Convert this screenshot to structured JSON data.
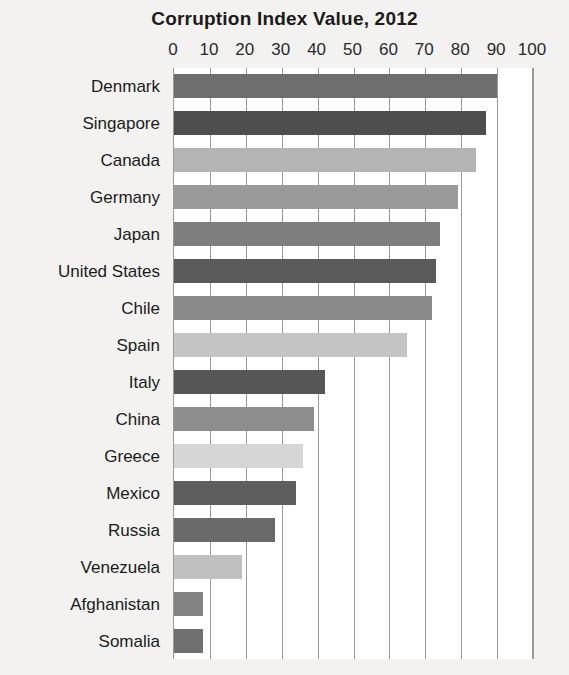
{
  "chart_data": {
    "type": "bar",
    "orientation": "horizontal",
    "title": "Corruption Index Value, 2012",
    "xlabel": "",
    "ylabel": "",
    "xlim": [
      0,
      100
    ],
    "xticks": [
      0,
      10,
      20,
      30,
      40,
      50,
      60,
      70,
      80,
      90,
      100
    ],
    "grid": true,
    "legend": "none",
    "categories": [
      "Denmark",
      "Singapore",
      "Canada",
      "Germany",
      "Japan",
      "United States",
      "Chile",
      "Spain",
      "Italy",
      "China",
      "Greece",
      "Mexico",
      "Russia",
      "Venezuela",
      "Afghanistan",
      "Somalia"
    ],
    "values": [
      90,
      87,
      84,
      79,
      74,
      73,
      72,
      65,
      42,
      39,
      36,
      34,
      28,
      19,
      8,
      8
    ],
    "bar_colors": [
      "#6e6e6e",
      "#4e4e4e",
      "#b4b4b4",
      "#9a9a9a",
      "#7e7e7e",
      "#5a5a5a",
      "#8a8a8a",
      "#c4c4c4",
      "#565656",
      "#8e8e8e",
      "#d6d6d6",
      "#5e5e5e",
      "#6a6a6a",
      "#c0c0c0",
      "#838383",
      "#707070"
    ],
    "plot_background": "#ffffff",
    "page_background": "#f3f2f0",
    "gridline_color": "#9a9a9a",
    "text_color": "#1b1b1b"
  }
}
